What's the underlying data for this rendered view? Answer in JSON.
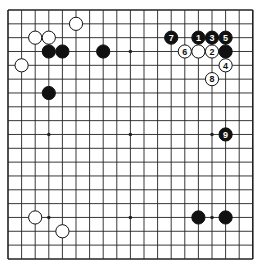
{
  "board": {
    "size": 19,
    "origin_x": 8,
    "origin_y": 10,
    "spacing_x": 13.6,
    "spacing_y": 13.83,
    "stone_radius": 6.6,
    "line_color": "#222222",
    "background": "#ffffff",
    "black_color": "#111111",
    "white_color": "#ffffff",
    "star_points": [
      [
        3,
        3
      ],
      [
        9,
        3
      ],
      [
        15,
        3
      ],
      [
        3,
        9
      ],
      [
        9,
        9
      ],
      [
        15,
        9
      ],
      [
        3,
        15
      ],
      [
        9,
        15
      ],
      [
        15,
        15
      ]
    ]
  },
  "stones": [
    {
      "color": "white",
      "col": 5,
      "row": 1,
      "label": ""
    },
    {
      "color": "white",
      "col": 2,
      "row": 2,
      "label": ""
    },
    {
      "color": "white",
      "col": 3,
      "row": 2,
      "label": ""
    },
    {
      "color": "black",
      "col": 3,
      "row": 3,
      "label": ""
    },
    {
      "color": "black",
      "col": 4,
      "row": 3,
      "label": ""
    },
    {
      "color": "black",
      "col": 7,
      "row": 3,
      "label": ""
    },
    {
      "color": "white",
      "col": 1,
      "row": 4,
      "label": ""
    },
    {
      "color": "black",
      "col": 3,
      "row": 6,
      "label": ""
    },
    {
      "color": "black",
      "col": 12,
      "row": 2,
      "label": "7"
    },
    {
      "color": "black",
      "col": 14,
      "row": 2,
      "label": "1"
    },
    {
      "color": "black",
      "col": 15,
      "row": 2,
      "label": "3"
    },
    {
      "color": "black",
      "col": 16,
      "row": 2,
      "label": "5"
    },
    {
      "color": "white",
      "col": 13,
      "row": 3,
      "label": "6"
    },
    {
      "color": "white",
      "col": 14,
      "row": 3,
      "label": ""
    },
    {
      "color": "white",
      "col": 15,
      "row": 3,
      "label": "2"
    },
    {
      "color": "black",
      "col": 16,
      "row": 3,
      "label": ""
    },
    {
      "color": "white",
      "col": 16,
      "row": 4,
      "label": "4"
    },
    {
      "color": "white",
      "col": 15,
      "row": 5,
      "label": "8"
    },
    {
      "color": "black",
      "col": 16,
      "row": 9,
      "label": "9"
    },
    {
      "color": "white",
      "col": 2,
      "row": 15,
      "label": ""
    },
    {
      "color": "white",
      "col": 4,
      "row": 16,
      "label": ""
    },
    {
      "color": "black",
      "col": 14,
      "row": 15,
      "label": ""
    },
    {
      "color": "black",
      "col": 16,
      "row": 15,
      "label": ""
    }
  ]
}
